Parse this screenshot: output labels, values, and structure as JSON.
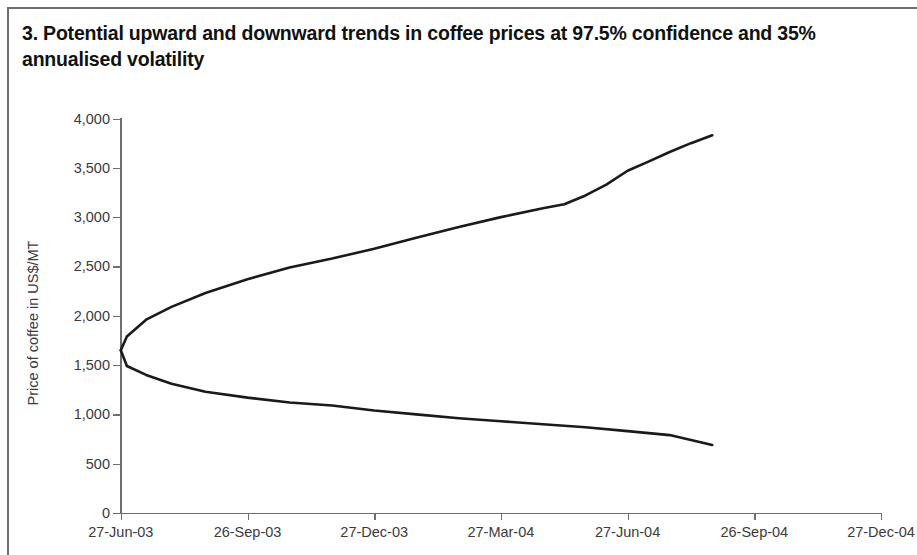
{
  "figure": {
    "title": "3. Potential upward and downward trends in coffee prices at 97.5% confidence and 35% annualised volatility",
    "title_line1": "3. Potential upward and downward trends in coffee prices at 97.5% confidence",
    "title_line2": "and 35% annualised volatility"
  },
  "chart_data": {
    "type": "line",
    "title": "3. Potential upward and downward trends in coffee prices at 97.5% confidence and 35% annualised volatility",
    "xlabel": "",
    "ylabel": "Price of coffee in US$/MT",
    "ylim": [
      0,
      4000
    ],
    "yticks": [
      0,
      500,
      1000,
      1500,
      2000,
      2500,
      3000,
      3500,
      4000
    ],
    "ytick_labels": [
      "0",
      "500",
      "1,000",
      "1,500",
      "2,000",
      "2,500",
      "3,000",
      "3,500",
      "4,000"
    ],
    "xticks": [
      "27-Jun-03",
      "26-Sep-03",
      "27-Dec-03",
      "27-Mar-04",
      "27-Jun-04",
      "26-Sep-04",
      "27-Dec-04"
    ],
    "grid": false,
    "legend": "none",
    "line_color": "#1a1a1a",
    "series": [
      {
        "name": "Upper bound (97.5% confidence)",
        "x": [
          "27-Jun-03",
          "26-Sep-03",
          "27-Dec-03",
          "27-Mar-04",
          "27-Jun-04",
          "26-Sep-04",
          "27-Dec-04"
        ],
        "values": [
          1650,
          2230,
          2580,
          2900,
          3170,
          3470,
          3830
        ]
      },
      {
        "name": "Lower bound (97.5% confidence)",
        "x": [
          "27-Jun-03",
          "26-Sep-03",
          "27-Dec-03",
          "27-Mar-04",
          "27-Jun-04",
          "26-Sep-04",
          "27-Dec-04"
        ],
        "values": [
          1650,
          1230,
          1090,
          960,
          870,
          770,
          690
        ]
      }
    ],
    "series_dense": {
      "upper": [
        [
          0.0,
          1650
        ],
        [
          0.012,
          1790
        ],
        [
          0.05,
          1960
        ],
        [
          0.1,
          2090
        ],
        [
          0.167,
          2230
        ],
        [
          0.25,
          2370
        ],
        [
          0.333,
          2490
        ],
        [
          0.417,
          2580
        ],
        [
          0.5,
          2680
        ],
        [
          0.583,
          2790
        ],
        [
          0.667,
          2900
        ],
        [
          0.75,
          3000
        ],
        [
          0.833,
          3090
        ],
        [
          0.875,
          3130
        ],
        [
          0.917,
          3220
        ],
        [
          0.958,
          3330
        ],
        [
          1.0,
          3470
        ],
        [
          1.04,
          3560
        ],
        [
          1.083,
          3660
        ],
        [
          1.125,
          3750
        ],
        [
          1.167,
          3830
        ]
      ],
      "lower": [
        [
          0.0,
          1650
        ],
        [
          0.012,
          1490
        ],
        [
          0.05,
          1400
        ],
        [
          0.1,
          1310
        ],
        [
          0.167,
          1230
        ],
        [
          0.25,
          1170
        ],
        [
          0.333,
          1120
        ],
        [
          0.417,
          1090
        ],
        [
          0.5,
          1040
        ],
        [
          0.583,
          1000
        ],
        [
          0.667,
          960
        ],
        [
          0.75,
          930
        ],
        [
          0.833,
          900
        ],
        [
          0.917,
          870
        ],
        [
          1.0,
          830
        ],
        [
          1.083,
          790
        ],
        [
          1.167,
          690
        ]
      ]
    }
  }
}
